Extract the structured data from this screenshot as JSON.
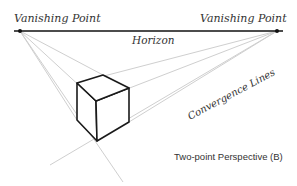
{
  "diagram": {
    "labels": {
      "vp_left": "Vanishing Point",
      "vp_right": "Vanishing Point",
      "horizon": "Horizon",
      "convergence": "Convergence Lines",
      "caption": "Two-point Perspective (B)"
    },
    "colors": {
      "horizon": "#111111",
      "convergence_lines": "#c8c8c8",
      "cube_edges": "#1a1a1a",
      "text": "#333333",
      "background": "#ffffff"
    },
    "geometry": {
      "horizon": {
        "x1": 14,
        "y1": 31,
        "x2": 283,
        "y2": 31
      },
      "vanishing_points": [
        {
          "name": "left",
          "x": 20,
          "y": 31
        },
        {
          "name": "right",
          "x": 277,
          "y": 31
        }
      ],
      "cube_vertices": {
        "top_left": [
          77,
          83
        ],
        "top_back": [
          103,
          75
        ],
        "top_right": [
          129,
          88
        ],
        "top_front": [
          96,
          101
        ],
        "bottom_left": [
          77,
          120
        ],
        "bottom_front": [
          97,
          141
        ],
        "bottom_right": [
          129,
          122
        ]
      }
    }
  }
}
